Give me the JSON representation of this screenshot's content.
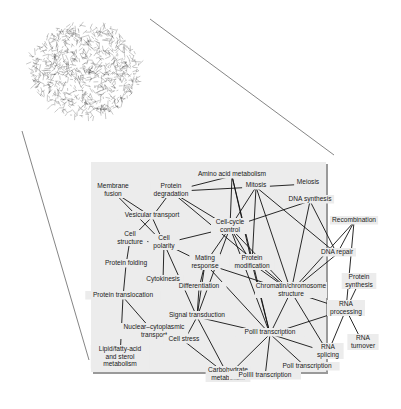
{
  "figure": {
    "panel": {
      "x": 91,
      "y": 162,
      "w": 235,
      "h": 210,
      "bg": "#ececec",
      "shadow": "#9a9a9a"
    },
    "hairball": {
      "cx": 85,
      "cy": 70,
      "r": 52
    },
    "zoom_lines": [
      {
        "x1": 150,
        "y1": 19,
        "x2": 334,
        "y2": 155
      },
      {
        "x1": 22,
        "y1": 131,
        "x2": 89,
        "y2": 360
      }
    ],
    "nodes": [
      {
        "id": "amino",
        "lines": [
          "Amino acid metabolism"
        ],
        "x": 232,
        "y": 176
      },
      {
        "id": "membrane",
        "lines": [
          "Membrane",
          "fusion"
        ],
        "x": 113,
        "y": 188
      },
      {
        "id": "protdeg",
        "lines": [
          "Protein",
          "degradation"
        ],
        "x": 171,
        "y": 188
      },
      {
        "id": "mitosis",
        "lines": [
          "Mitosis"
        ],
        "x": 256,
        "y": 187
      },
      {
        "id": "meiosis",
        "lines": [
          "Meiosis"
        ],
        "x": 308,
        "y": 184
      },
      {
        "id": "dnasyn",
        "lines": [
          "DNA synthesis"
        ],
        "x": 310,
        "y": 201
      },
      {
        "id": "vesicular",
        "lines": [
          "Vesicular transport"
        ],
        "x": 152,
        "y": 217
      },
      {
        "id": "cellcycle",
        "lines": [
          "Cell-cycle",
          "control"
        ],
        "x": 230,
        "y": 224
      },
      {
        "id": "recomb",
        "lines": [
          "Recombination"
        ],
        "x": 354,
        "y": 222
      },
      {
        "id": "cellstruct",
        "lines": [
          "Cell",
          "structure"
        ],
        "x": 130,
        "y": 236
      },
      {
        "id": "cellpol",
        "lines": [
          "Cell",
          "polarity"
        ],
        "x": 164,
        "y": 240
      },
      {
        "id": "mating",
        "lines": [
          "Mating",
          "response"
        ],
        "x": 205,
        "y": 260
      },
      {
        "id": "protmod",
        "lines": [
          "Protein",
          "modification"
        ],
        "x": 252,
        "y": 260
      },
      {
        "id": "dnarepair",
        "lines": [
          "DNA repair"
        ],
        "x": 337,
        "y": 254
      },
      {
        "id": "protfold",
        "lines": [
          "Protein folding"
        ],
        "x": 126,
        "y": 265
      },
      {
        "id": "cytokinesis",
        "lines": [
          "Cytokinesis"
        ],
        "x": 163,
        "y": 281
      },
      {
        "id": "diff",
        "lines": [
          "Differentiation"
        ],
        "x": 199,
        "y": 288
      },
      {
        "id": "chromatin",
        "lines": [
          "Chromatin/chromosome",
          "structure"
        ],
        "x": 291,
        "y": 288
      },
      {
        "id": "protsyn",
        "lines": [
          "Protein",
          "synthesis"
        ],
        "x": 359,
        "y": 279
      },
      {
        "id": "prottrans",
        "lines": [
          "Protein translocation"
        ],
        "x": 123,
        "y": 297
      },
      {
        "id": "rnaproc",
        "lines": [
          "RNA",
          "processing"
        ],
        "x": 346,
        "y": 306
      },
      {
        "id": "signal",
        "lines": [
          "Signal transduction"
        ],
        "x": 197,
        "y": 317
      },
      {
        "id": "nuccyto",
        "lines": [
          "Nuclear–cytoplasmic",
          "transport"
        ],
        "x": 154,
        "y": 329
      },
      {
        "id": "pol2",
        "lines": [
          "PolII transcription"
        ],
        "x": 270,
        "y": 334
      },
      {
        "id": "cellstress",
        "lines": [
          "Cell stress"
        ],
        "x": 184,
        "y": 341
      },
      {
        "id": "rnaturn",
        "lines": [
          "RNA",
          "turnover"
        ],
        "x": 363,
        "y": 340
      },
      {
        "id": "lipid",
        "lines": [
          "Lipid/fatty-acid",
          "and sterol",
          "metabolism"
        ],
        "x": 120,
        "y": 351
      },
      {
        "id": "rnasplice",
        "lines": [
          "RNA",
          "splicing"
        ],
        "x": 328,
        "y": 349
      },
      {
        "id": "pol1",
        "lines": [
          "PolI transcription"
        ],
        "x": 307,
        "y": 368
      },
      {
        "id": "carb",
        "lines": [
          "Carbohydrate",
          "metabolism"
        ],
        "x": 228,
        "y": 372
      },
      {
        "id": "pol3",
        "lines": [
          "PolIII transcription"
        ],
        "x": 265,
        "y": 377
      }
    ],
    "edges": [
      [
        "amino",
        "protdeg"
      ],
      [
        "amino",
        "cellcycle"
      ],
      [
        "amino",
        "pol2"
      ],
      [
        "amino",
        "protmod"
      ],
      [
        "protdeg",
        "mitosis"
      ],
      [
        "protdeg",
        "cellcycle"
      ],
      [
        "protdeg",
        "vesicular"
      ],
      [
        "protdeg",
        "chromatin"
      ],
      [
        "mitosis",
        "meiosis"
      ],
      [
        "mitosis",
        "cellcycle"
      ],
      [
        "mitosis",
        "protmod"
      ],
      [
        "mitosis",
        "chromatin"
      ],
      [
        "mitosis",
        "dnarepair"
      ],
      [
        "membrane",
        "vesicular"
      ],
      [
        "membrane",
        "cellpol"
      ],
      [
        "vesicular",
        "cellstruct"
      ],
      [
        "vesicular",
        "cellpol"
      ],
      [
        "dnasyn",
        "cellcycle"
      ],
      [
        "dnasyn",
        "chromatin"
      ],
      [
        "dnasyn",
        "dnarepair"
      ],
      [
        "cellcycle",
        "cellpol"
      ],
      [
        "cellcycle",
        "mating"
      ],
      [
        "cellcycle",
        "protmod"
      ],
      [
        "cellcycle",
        "chromatin"
      ],
      [
        "cellcycle",
        "signal"
      ],
      [
        "cellcycle",
        "pol2"
      ],
      [
        "recomb",
        "dnarepair"
      ],
      [
        "recomb",
        "chromatin"
      ],
      [
        "recomb",
        "rnaproc"
      ],
      [
        "cellstruct",
        "cellpol"
      ],
      [
        "cellstruct",
        "protfold"
      ],
      [
        "cellpol",
        "mating"
      ],
      [
        "cellpol",
        "cytokinesis"
      ],
      [
        "cellpol",
        "signal"
      ],
      [
        "mating",
        "diff"
      ],
      [
        "mating",
        "signal"
      ],
      [
        "mating",
        "pol2"
      ],
      [
        "mating",
        "chromatin"
      ],
      [
        "protmod",
        "chromatin"
      ],
      [
        "protmod",
        "pol2"
      ],
      [
        "dnarepair",
        "chromatin"
      ],
      [
        "protfold",
        "prottrans"
      ],
      [
        "diff",
        "signal"
      ],
      [
        "chromatin",
        "pol2"
      ],
      [
        "chromatin",
        "rnaproc"
      ],
      [
        "chromatin",
        "rnasplice"
      ],
      [
        "protsyn",
        "rnaproc"
      ],
      [
        "prottrans",
        "nuccyto"
      ],
      [
        "prottrans",
        "lipid"
      ],
      [
        "rnaproc",
        "pol2"
      ],
      [
        "rnaproc",
        "rnaturn"
      ],
      [
        "rnaproc",
        "rnasplice"
      ],
      [
        "signal",
        "pol2"
      ],
      [
        "signal",
        "cellstress"
      ],
      [
        "signal",
        "carb"
      ],
      [
        "pol2",
        "carb"
      ],
      [
        "pol2",
        "pol1"
      ],
      [
        "pol2",
        "pol3"
      ],
      [
        "pol2",
        "rnasplice"
      ],
      [
        "cellstress",
        "carb"
      ]
    ]
  }
}
